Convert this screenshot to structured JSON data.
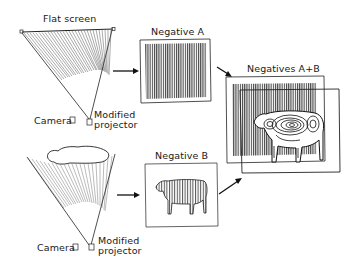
{
  "diagram": {
    "top_setup": {
      "screen_label": "Flat screen",
      "camera_label": "Camera",
      "projector_label_line1": "Modified",
      "projector_label_line2": "projector"
    },
    "bottom_setup": {
      "camera_label": "Camera",
      "projector_label_line1": "Modified",
      "projector_label_line2": "projector",
      "object": "cow silhouette (screen shadow)"
    },
    "panels": {
      "negative_a": {
        "label": "Negative A",
        "content": "vertical line grating"
      },
      "negative_b": {
        "label": "Negative B",
        "content": "cow with line pattern"
      },
      "negatives_ab": {
        "label": "Negatives A+B",
        "content": "moiré contour cow (superimposed)"
      }
    },
    "colors": {
      "ink": "#1a1a1a",
      "background": "#ffffff",
      "hatch": "#555555"
    }
  }
}
